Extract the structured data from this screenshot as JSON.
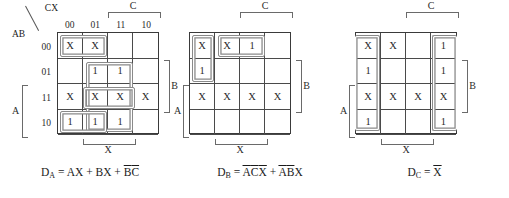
{
  "diagram": {
    "col_header_group": "CX",
    "row_header_group": "AB",
    "col_labels": [
      "00",
      "01",
      "11",
      "10"
    ],
    "row_labels": [
      "00",
      "01",
      "11",
      "10"
    ],
    "bracket_labels": {
      "a": "A",
      "b": "B",
      "c": "C",
      "x": "X"
    },
    "colors": {
      "grid_line": "#4a4a4a",
      "border": "#3a3a3a",
      "loop": "#8a8a8a",
      "text": "#1a1a1a"
    }
  },
  "maps": [
    {
      "id": "kmap-a",
      "output": "D",
      "output_sub": "A",
      "cells": [
        [
          "X",
          "X",
          "",
          ""
        ],
        [
          "",
          "1",
          "1",
          ""
        ],
        [
          "X",
          "X",
          "X",
          "X"
        ],
        [
          "1",
          "1",
          "1",
          ""
        ]
      ],
      "groups": [
        {
          "name": "group-bc-bar",
          "row": 0,
          "col": 0,
          "rows": 1,
          "cols": 2
        },
        {
          "name": "group-bx",
          "row": 1,
          "col": 1,
          "rows": 3,
          "cols": 2
        },
        {
          "name": "group-ax",
          "row": 3,
          "col": 0,
          "rows": 1,
          "cols": 2
        },
        {
          "name": "group-ax-row11",
          "row": 2,
          "col": 1,
          "rows": 1,
          "cols": 2
        }
      ],
      "equation": {
        "lhs": "D",
        "lhs_sub": "A",
        "terms": [
          {
            "text": "AX",
            "bars": []
          },
          {
            "text": "BX",
            "bars": []
          },
          {
            "text": "BC",
            "bars": [
              0,
              1
            ]
          }
        ],
        "plain": "D_A = AX + BX + B'C'"
      }
    },
    {
      "id": "kmap-b",
      "output": "D",
      "output_sub": "B",
      "cells": [
        [
          "X",
          "X",
          "1",
          ""
        ],
        [
          "1",
          "",
          "",
          ""
        ],
        [
          "X",
          "X",
          "X",
          "X"
        ],
        [
          "",
          "",
          "",
          ""
        ]
      ],
      "groups": [
        {
          "name": "group-acx",
          "row": 0,
          "col": 0,
          "rows": 2,
          "cols": 1
        },
        {
          "name": "group-abx",
          "row": 0,
          "col": 1,
          "rows": 1,
          "cols": 2
        }
      ],
      "equation": {
        "lhs": "D",
        "lhs_sub": "B",
        "terms": [
          {
            "text": "ACX",
            "bars": [
              0,
              1,
              2
            ]
          },
          {
            "text": "ABX",
            "bars": [
              0,
              1
            ]
          }
        ],
        "plain": "D_B = A'C'X' + A'B'X"
      }
    },
    {
      "id": "kmap-c",
      "output": "D",
      "output_sub": "C",
      "cells": [
        [
          "X",
          "X",
          "",
          "1"
        ],
        [
          "1",
          "",
          "",
          "1"
        ],
        [
          "X",
          "X",
          "X",
          "X"
        ],
        [
          "1",
          "",
          "",
          "1"
        ]
      ],
      "groups": [
        {
          "name": "group-x-bar-left",
          "row": 0,
          "col": 0,
          "rows": 4,
          "cols": 1
        },
        {
          "name": "group-x-bar-right",
          "row": 0,
          "col": 3,
          "rows": 4,
          "cols": 1
        }
      ],
      "equation": {
        "lhs": "D",
        "lhs_sub": "C",
        "terms": [
          {
            "text": "X",
            "bars": [
              0
            ]
          }
        ],
        "plain": "D_C = X'"
      }
    }
  ]
}
